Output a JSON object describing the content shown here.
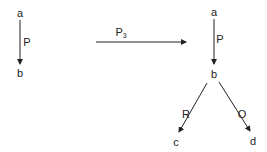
{
  "diagram": {
    "left": {
      "node_top": "a",
      "node_bottom": "b",
      "edge_label": "P"
    },
    "transform": {
      "label": "P",
      "subscript": "3"
    },
    "right": {
      "node_top": "a",
      "node_mid": "b",
      "node_left": "c",
      "node_right": "d",
      "edge_ab_label": "P",
      "edge_bc_label": "R",
      "edge_bd_label": "O"
    },
    "colors": {
      "stroke": "#222222",
      "background": "#ffffff"
    }
  }
}
